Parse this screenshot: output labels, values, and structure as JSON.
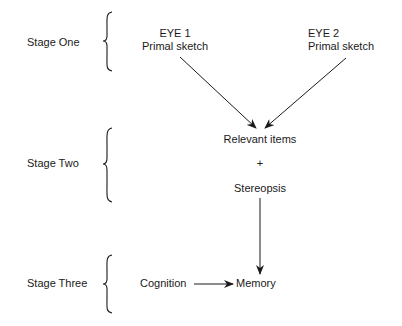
{
  "stages": [
    {
      "label": "Stage One"
    },
    {
      "label": "Stage Two"
    },
    {
      "label": "Stage Three"
    }
  ],
  "stage_one": {
    "eye1": {
      "title": "EYE 1",
      "subtitle": "Primal sketch"
    },
    "eye2": {
      "title": "EYE 2",
      "subtitle": "Primal sketch"
    }
  },
  "stage_two": {
    "relevant": "Relevant items",
    "plus": "+",
    "stereopsis": "Stereopsis"
  },
  "stage_three": {
    "cognition": "Cognition",
    "memory": "Memory"
  },
  "colors": {
    "ink": "#1a1a1a",
    "background": "#ffffff"
  }
}
